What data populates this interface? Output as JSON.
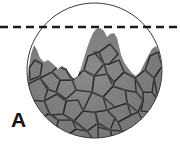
{
  "figure": {
    "panel_label": "A",
    "background_color": "#ffffff",
    "circle": {
      "name": "specimen-circle",
      "center_x": 94.5,
      "center_y": 70.5,
      "radius": 67.5,
      "stroke_color": "#3a3a3a",
      "stroke_width": 1,
      "fill_color": "#ffffff"
    },
    "dashed_line": {
      "name": "reference-level-line",
      "y": 27,
      "x_start": 0,
      "x_end": 180,
      "color": "#1a1a1a",
      "stroke_width": 2.4,
      "dash_length": 8,
      "gap_length": 5
    },
    "material": {
      "name": "aggregate-fill",
      "fill_color": "#7a7a7a",
      "fill_color_light": "#8d8d8d",
      "fill_color_dark": "#6a6a6a",
      "crack_color": "#2e2e2e",
      "crack_width": 1.6,
      "peak_apex_x": 101,
      "peak_apex_y": 28,
      "left_shoulder_x": 33,
      "left_shoulder_y": 45,
      "right_shoulder_x": 157,
      "right_shoulder_y": 47,
      "surface_profile": [
        [
          27.5,
          82
        ],
        [
          29,
          66
        ],
        [
          31,
          54
        ],
        [
          34,
          45
        ],
        [
          37,
          50
        ],
        [
          40,
          58
        ],
        [
          44,
          62
        ],
        [
          48,
          60
        ],
        [
          53,
          64
        ],
        [
          58,
          69
        ],
        [
          62,
          66
        ],
        [
          66,
          68
        ],
        [
          70,
          74
        ],
        [
          74,
          79
        ],
        [
          78,
          76
        ],
        [
          81,
          68
        ],
        [
          84,
          58
        ],
        [
          87,
          48
        ],
        [
          90,
          40
        ],
        [
          93,
          33
        ],
        [
          96,
          29
        ],
        [
          100,
          28
        ],
        [
          104,
          31
        ],
        [
          107,
          37
        ],
        [
          110,
          34
        ],
        [
          114,
          33
        ],
        [
          117,
          38
        ],
        [
          119,
          46
        ],
        [
          121,
          55
        ],
        [
          124,
          62
        ],
        [
          128,
          68
        ],
        [
          132,
          73
        ],
        [
          136,
          76
        ],
        [
          140,
          72
        ],
        [
          144,
          64
        ],
        [
          148,
          56
        ],
        [
          152,
          49
        ],
        [
          156,
          46
        ],
        [
          159,
          52
        ],
        [
          161,
          62
        ],
        [
          162,
          74
        ]
      ],
      "crack_polygons": [
        [
          [
            28,
            84
          ],
          [
            40,
            78
          ],
          [
            48,
            88
          ],
          [
            44,
            101
          ],
          [
            31,
            100
          ]
        ],
        [
          [
            40,
            78
          ],
          [
            52,
            72
          ],
          [
            60,
            80
          ],
          [
            56,
            92
          ],
          [
            47,
            89
          ]
        ],
        [
          [
            31,
            100
          ],
          [
            44,
            101
          ],
          [
            49,
            113
          ],
          [
            40,
            120
          ],
          [
            30,
            112
          ]
        ],
        [
          [
            44,
            101
          ],
          [
            57,
            94
          ],
          [
            66,
            101
          ],
          [
            63,
            114
          ],
          [
            50,
            115
          ]
        ],
        [
          [
            56,
            92
          ],
          [
            60,
            80
          ],
          [
            72,
            80
          ],
          [
            76,
            90
          ],
          [
            66,
            99
          ]
        ],
        [
          [
            63,
            114
          ],
          [
            66,
            101
          ],
          [
            78,
            100
          ],
          [
            83,
            111
          ],
          [
            74,
            121
          ]
        ],
        [
          [
            40,
            120
          ],
          [
            49,
            113
          ],
          [
            58,
            120
          ],
          [
            56,
            131
          ],
          [
            45,
            130
          ]
        ],
        [
          [
            56,
            131
          ],
          [
            58,
            120
          ],
          [
            72,
            120
          ],
          [
            76,
            129
          ],
          [
            66,
            136
          ]
        ],
        [
          [
            74,
            121
          ],
          [
            83,
            111
          ],
          [
            95,
            112
          ],
          [
            98,
            123
          ],
          [
            87,
            131
          ]
        ],
        [
          [
            76,
            90
          ],
          [
            72,
            80
          ],
          [
            84,
            70
          ],
          [
            94,
            76
          ],
          [
            92,
            92
          ]
        ],
        [
          [
            84,
            70
          ],
          [
            88,
            56
          ],
          [
            99,
            52
          ],
          [
            104,
            64
          ],
          [
            94,
            76
          ]
        ],
        [
          [
            92,
            92
          ],
          [
            94,
            76
          ],
          [
            107,
            74
          ],
          [
            113,
            86
          ],
          [
            103,
            97
          ]
        ],
        [
          [
            83,
            111
          ],
          [
            92,
            92
          ],
          [
            103,
            97
          ],
          [
            107,
            110
          ],
          [
            95,
            112
          ]
        ],
        [
          [
            95,
            112
          ],
          [
            107,
            110
          ],
          [
            115,
            118
          ],
          [
            110,
            130
          ],
          [
            98,
            127
          ]
        ],
        [
          [
            66,
            136
          ],
          [
            76,
            129
          ],
          [
            87,
            131
          ],
          [
            92,
            138
          ],
          [
            76,
            140
          ]
        ],
        [
          [
            98,
            123
          ],
          [
            110,
            130
          ],
          [
            112,
            138
          ],
          [
            98,
            139
          ]
        ],
        [
          [
            103,
            97
          ],
          [
            113,
            86
          ],
          [
            125,
            90
          ],
          [
            127,
            103
          ],
          [
            115,
            107
          ]
        ],
        [
          [
            107,
            110
          ],
          [
            115,
            107
          ],
          [
            127,
            103
          ],
          [
            131,
            115
          ],
          [
            118,
            122
          ]
        ],
        [
          [
            94,
            52
          ],
          [
            99,
            52
          ],
          [
            110,
            44
          ],
          [
            118,
            54
          ],
          [
            109,
            64
          ],
          [
            104,
            64
          ]
        ],
        [
          [
            104,
            64
          ],
          [
            109,
            64
          ],
          [
            119,
            60
          ],
          [
            124,
            72
          ],
          [
            114,
            82
          ],
          [
            107,
            74
          ]
        ],
        [
          [
            113,
            86
          ],
          [
            114,
            82
          ],
          [
            124,
            72
          ],
          [
            135,
            78
          ],
          [
            136,
            92
          ],
          [
            125,
            90
          ]
        ],
        [
          [
            125,
            90
          ],
          [
            136,
            92
          ],
          [
            143,
            100
          ],
          [
            138,
            112
          ],
          [
            127,
            103
          ]
        ],
        [
          [
            118,
            122
          ],
          [
            131,
            115
          ],
          [
            138,
            112
          ],
          [
            143,
            122
          ],
          [
            133,
            132
          ],
          [
            122,
            131
          ]
        ],
        [
          [
            110,
            130
          ],
          [
            122,
            131
          ],
          [
            125,
            138
          ],
          [
            112,
            139
          ]
        ],
        [
          [
            135,
            78
          ],
          [
            145,
            70
          ],
          [
            154,
            78
          ],
          [
            152,
            92
          ],
          [
            143,
            92
          ]
        ],
        [
          [
            143,
            100
          ],
          [
            143,
            92
          ],
          [
            152,
            92
          ],
          [
            158,
            100
          ],
          [
            153,
            112
          ],
          [
            141,
            111
          ]
        ],
        [
          [
            133,
            132
          ],
          [
            143,
            122
          ],
          [
            153,
            112
          ],
          [
            158,
            118
          ],
          [
            150,
            130
          ],
          [
            140,
            136
          ]
        ],
        [
          [
            145,
            70
          ],
          [
            150,
            56
          ],
          [
            158,
            52
          ],
          [
            162,
            66
          ],
          [
            154,
            78
          ]
        ],
        [
          [
            154,
            78
          ],
          [
            162,
            66
          ],
          [
            165,
            80
          ],
          [
            158,
            100
          ]
        ],
        [
          [
            29,
            68
          ],
          [
            35,
            60
          ],
          [
            42,
            64
          ],
          [
            40,
            76
          ],
          [
            30,
            80
          ]
        ],
        [
          [
            52,
            72
          ],
          [
            58,
            66
          ],
          [
            66,
            70
          ],
          [
            72,
            80
          ],
          [
            60,
            80
          ]
        ],
        [
          [
            66,
            70
          ],
          [
            70,
            62
          ],
          [
            78,
            66
          ],
          [
            80,
            74
          ],
          [
            72,
            80
          ]
        ]
      ]
    }
  }
}
